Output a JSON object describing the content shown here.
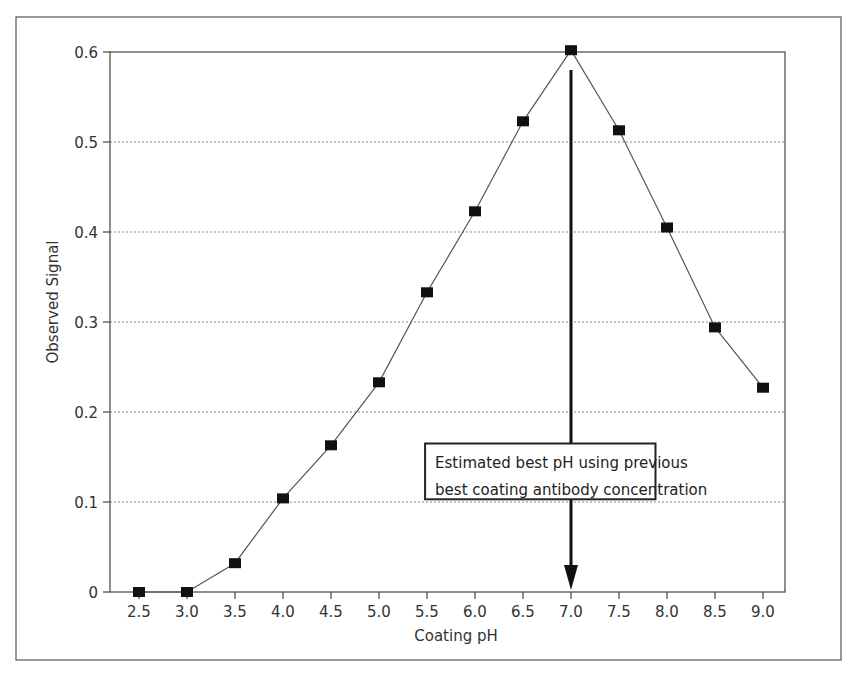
{
  "chart_data": {
    "type": "line",
    "title": "",
    "xlabel": "Coating pH",
    "ylabel": "Observed Signal",
    "x": [
      2.5,
      3.0,
      3.5,
      4.0,
      4.5,
      5.0,
      5.5,
      6.0,
      6.5,
      7.0,
      7.5,
      8.0,
      8.5,
      9.0
    ],
    "series": [
      {
        "name": "Observed Signal",
        "marker": "square",
        "values": [
          0.0,
          0.0,
          0.032,
          0.104,
          0.163,
          0.233,
          0.333,
          0.423,
          0.523,
          0.602,
          0.513,
          0.405,
          0.294,
          0.227
        ]
      }
    ],
    "xticks": [
      "2.5",
      "3.0",
      "3.5",
      "4.0",
      "4.5",
      "5.0",
      "5.5",
      "6.0",
      "6.5",
      "7.0",
      "7.5",
      "8.0",
      "8.5",
      "9.0"
    ],
    "yticks": [
      "0",
      "0.1",
      "0.2",
      "0.3",
      "0.4",
      "0.5",
      "0.6"
    ],
    "ytick_values": [
      0,
      0.1,
      0.2,
      0.3,
      0.4,
      0.5,
      0.6
    ],
    "xlim": [
      2.2,
      9.3
    ],
    "ylim": [
      0,
      0.6
    ],
    "grid": "horizontal-dotted",
    "legend": "none",
    "annotation": {
      "lines": [
        "Estimated best pH using previous",
        "best coating antibody concentration"
      ],
      "arrow_x": 7.0,
      "arrow_from_y": 0.58,
      "arrow_to_y": 0.0,
      "box_x_range": [
        5.48,
        7.88
      ],
      "box_y_range": [
        0.103,
        0.165
      ]
    },
    "colors": {
      "line": "#555555",
      "marker": "#111111",
      "grid": "#888888",
      "axis": "#444444",
      "arrow": "#111111"
    }
  }
}
